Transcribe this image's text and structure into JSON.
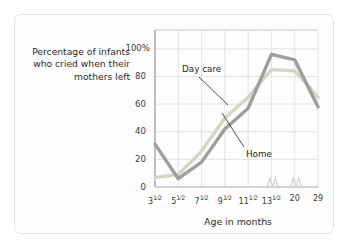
{
  "figure": {
    "card_bg": "#fdfdfd",
    "card_border": "#e2e2e0"
  },
  "chart_data": {
    "type": "line",
    "title": "",
    "ylabel": "Percentage of infants who cried when their mothers left",
    "xlabel": "Age in months",
    "categories": [
      "3½",
      "5½",
      "7½",
      "9½",
      "11½",
      "13½",
      "20",
      "29"
    ],
    "ylim": [
      0,
      110
    ],
    "ytick_values": [
      0,
      20,
      40,
      60,
      80,
      100
    ],
    "ytick_labels": [
      "0",
      "20",
      "40",
      "60",
      "80",
      "100%"
    ],
    "grid": true,
    "legend": "inline-annotations",
    "axis_break": true,
    "series": [
      {
        "name": "Day care",
        "color": "#d8d4c8",
        "values": [
          7,
          9,
          26,
          50,
          65,
          85,
          84,
          65
        ]
      },
      {
        "name": "Home",
        "color": "#9e9e9e",
        "values": [
          31,
          6,
          18,
          42,
          57,
          96,
          92,
          58
        ]
      }
    ]
  },
  "annotations": {
    "daycare_label": "Day care",
    "home_label": "Home"
  },
  "axis": {
    "xlabel_text": "Age in months"
  }
}
